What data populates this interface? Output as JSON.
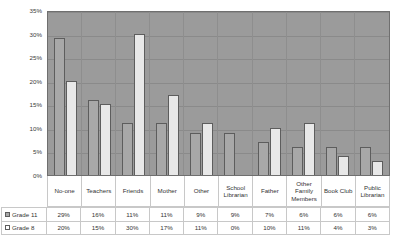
{
  "chart_data": {
    "type": "bar",
    "title": "",
    "subtitle": "",
    "xlabel": "",
    "ylabel": "",
    "ylim": [
      0,
      35
    ],
    "grid": true,
    "legend_position": "table-left",
    "y_ticks": [
      "0%",
      "5%",
      "10%",
      "15%",
      "20%",
      "25%",
      "30%",
      "35%"
    ],
    "y_tick_values": [
      0,
      5,
      10,
      15,
      20,
      25,
      30,
      35
    ],
    "categories": [
      "No-one",
      "Teachers",
      "Friends",
      "Mother",
      "Other",
      "School Librarian",
      "Father",
      "Other Family Members",
      "Book Club",
      "Public Librarian"
    ],
    "series": [
      {
        "name": "Grade 11",
        "color": "#a8a8a8",
        "values": [
          29,
          16,
          11,
          11,
          9,
          9,
          7,
          6,
          6,
          6
        ],
        "labels": [
          "29%",
          "16%",
          "11%",
          "11%",
          "9%",
          "9%",
          "7%",
          "6%",
          "6%",
          "6%"
        ]
      },
      {
        "name": "Grade 8",
        "color": "#e8e8e8",
        "values": [
          20,
          15,
          30,
          17,
          11,
          0,
          10,
          11,
          4,
          3
        ],
        "labels": [
          "20%",
          "15%",
          "30%",
          "17%",
          "11%",
          "0%",
          "10%",
          "11%",
          "4%",
          "3%"
        ]
      }
    ]
  },
  "colors": {
    "plot_background": "#9b9b9b",
    "grid": "#8a8a8a",
    "series1": "#a8a8a8",
    "series2": "#e8e8e8",
    "border": "#6f6f6f",
    "table_border": "#c8c8c8",
    "text": "#333333"
  }
}
